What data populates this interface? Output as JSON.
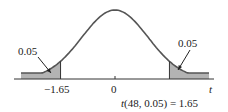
{
  "chart_data": {
    "type": "area",
    "title": "",
    "distribution": "t",
    "degrees_of_freedom": 48,
    "alpha": 0.05,
    "critical_value": 1.65,
    "xlabel": "t",
    "ylabel": "",
    "x_ticks": [
      "-1.65",
      "0"
    ],
    "shaded_regions": [
      {
        "name": "left-tail",
        "from": "-inf",
        "to": -1.65,
        "area_label": "0.05"
      },
      {
        "name": "right-tail",
        "from": 1.65,
        "to": "inf",
        "area_label": "0.05"
      }
    ],
    "annotation": "t(48, 0.05) = 1.65",
    "x_range": [
      -3,
      3
    ],
    "grid": false,
    "legend": "none"
  },
  "labels": {
    "left_area": "0.05",
    "right_area": "0.05",
    "left_tick": "−1.65",
    "center_tick": "0",
    "axis_label": "t",
    "annotation_prefix": "t",
    "annotation_rest": "(48, 0.05) = 1.65"
  },
  "colors": {
    "curve": "#555555",
    "shade": "#b3b3b3",
    "axis": "#333333"
  }
}
